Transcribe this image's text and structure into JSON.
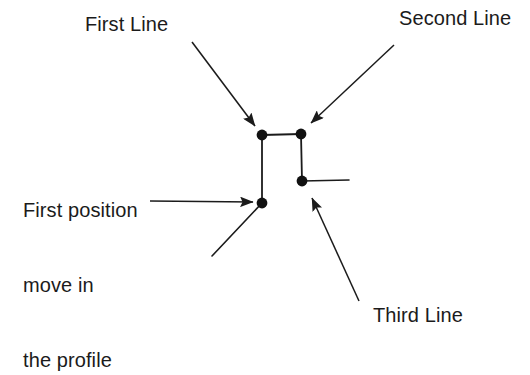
{
  "diagram": {
    "background_color": "#ffffff",
    "stroke_color": "#1b1b1b",
    "node_color": "#111111",
    "labels": {
      "first_line": "First Line",
      "second_line": "Second Line",
      "third_line": "Third Line",
      "first_position_line1": "First position",
      "first_position_line2": "move in",
      "first_position_line3": "the profile"
    },
    "nodes": [
      {
        "name": "node-top-left",
        "x": 262,
        "y": 135,
        "r": 5.5
      },
      {
        "name": "node-top-right",
        "x": 301,
        "y": 134,
        "r": 5.5
      },
      {
        "name": "node-mid-right",
        "x": 302,
        "y": 181,
        "r": 5.5
      },
      {
        "name": "node-lower-left",
        "x": 262,
        "y": 203,
        "r": 5.5
      }
    ],
    "segments": [
      {
        "name": "segment-top-horizontal",
        "x1": 262,
        "y1": 135,
        "x2": 301,
        "y2": 134
      },
      {
        "name": "segment-left-vertical",
        "x1": 262,
        "y1": 135,
        "x2": 262,
        "y2": 203
      },
      {
        "name": "segment-right-vertical",
        "x1": 301,
        "y1": 134,
        "x2": 302,
        "y2": 181
      },
      {
        "name": "segment-right-stub",
        "x1": 302,
        "y1": 181,
        "x2": 349,
        "y2": 180
      },
      {
        "name": "segment-lower-left-tail",
        "x1": 262,
        "y1": 203,
        "x2": 212,
        "y2": 256
      }
    ],
    "arrows": [
      {
        "name": "arrow-first-line",
        "x1": 192,
        "y1": 42,
        "x2": 259,
        "y2": 131
      },
      {
        "name": "arrow-second-line",
        "x1": 394,
        "y1": 45,
        "x2": 306,
        "y2": 128
      },
      {
        "name": "arrow-first-position",
        "x1": 150,
        "y1": 201,
        "x2": 259,
        "y2": 202
      },
      {
        "name": "arrow-third-line",
        "x1": 359,
        "y1": 301,
        "x2": 309,
        "y2": 192
      }
    ]
  }
}
